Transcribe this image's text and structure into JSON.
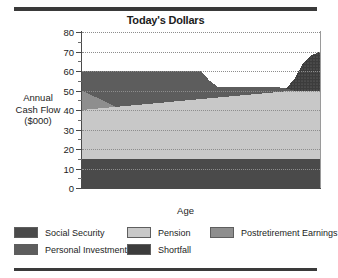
{
  "chart_title": "Today's Dollars",
  "axes": {
    "xlabel": "Age",
    "ylabel_lines": [
      "Annual",
      "Cash Flow",
      "($000)"
    ],
    "ylabel": "Annual Cash Flow ($000)",
    "yticks": [
      "80",
      "70",
      "60",
      "50",
      "40",
      "30",
      "20",
      "10",
      "0"
    ],
    "xticks": [
      "62",
      "67",
      "72",
      "77",
      "82",
      "87",
      "90"
    ]
  },
  "legend": {
    "items": [
      {
        "label": "Social Security",
        "color": "#4a4a4a",
        "pattern": "solid"
      },
      {
        "label": "Pension",
        "color": "#c8c8c8",
        "pattern": "solid"
      },
      {
        "label": "Postretirement Earnings",
        "color": "#8e8e8e",
        "pattern": "solid"
      },
      {
        "label": "Personal Investments",
        "color": "#5d5d5d",
        "pattern": "solid"
      },
      {
        "label": "Shortfall",
        "color": "#3c3c3c",
        "pattern": "dotted"
      }
    ]
  },
  "chart_data": {
    "type": "area",
    "stacked": true,
    "title": "Today's Dollars",
    "xlabel": "Age",
    "ylabel": "Annual Cash Flow ($000)",
    "xlim": [
      62,
      90
    ],
    "ylim": [
      0,
      80
    ],
    "ytick_step": 10,
    "grid": "horizontal-dotted",
    "legend_position": "bottom",
    "x": [
      62,
      63,
      64,
      65,
      66,
      67,
      68,
      69,
      70,
      71,
      72,
      73,
      74,
      75,
      76,
      77,
      78,
      79,
      80,
      81,
      82,
      83,
      84,
      85,
      86,
      87,
      88,
      89,
      90
    ],
    "series": [
      {
        "name": "Social Security",
        "color": "#4a4a4a",
        "values": [
          15,
          15,
          15,
          15,
          15,
          15,
          15,
          15,
          15,
          15,
          15,
          15,
          15,
          15,
          15,
          15,
          15,
          15,
          15,
          15,
          15,
          15,
          15,
          15,
          15,
          15,
          15,
          15,
          15
        ]
      },
      {
        "name": "Pension",
        "color": "#c8c8c8",
        "values": [
          25,
          25.4,
          25.8,
          26.2,
          26.6,
          27,
          27.4,
          27.8,
          28.2,
          28.6,
          29,
          29.4,
          29.8,
          30.2,
          30.6,
          31,
          31.4,
          31.8,
          32.2,
          32.6,
          33,
          33.4,
          33.8,
          34.2,
          34.6,
          35,
          35,
          35,
          35
        ]
      },
      {
        "name": "Postretirement Earnings",
        "color": "#8e8e8e",
        "values": [
          10,
          7.5,
          5,
          2.5,
          0,
          0,
          0,
          0,
          0,
          0,
          0,
          0,
          0,
          0,
          0,
          0,
          0,
          0,
          0,
          0,
          0,
          0,
          0,
          0,
          0,
          0,
          0,
          0,
          0
        ]
      },
      {
        "name": "Personal Investments",
        "color": "#5d5d5d",
        "values": [
          10,
          12.1,
          14.2,
          16.3,
          18.4,
          18,
          17.6,
          17.2,
          16.8,
          16.4,
          16,
          15.6,
          15.2,
          14.8,
          14.4,
          9,
          5.4,
          5,
          4.6,
          4.2,
          3.8,
          3.4,
          3,
          2.6,
          1.4,
          0,
          0,
          0,
          0
        ]
      },
      {
        "name": "Shortfall",
        "color": "#3c3c3c",
        "values": [
          0,
          0,
          0,
          0,
          0,
          0,
          0,
          0,
          0,
          0,
          0,
          0,
          0,
          0,
          0,
          0,
          0,
          0,
          0,
          0,
          0,
          0,
          0,
          0,
          0,
          6,
          14,
          18,
          20
        ]
      }
    ],
    "totals": [
      60,
      60,
      60,
      60,
      60,
      60,
      60,
      60,
      60,
      60,
      60,
      60,
      60,
      60,
      60,
      55,
      51.8,
      51.8,
      51.8,
      51.8,
      51.8,
      51.8,
      51.8,
      51.8,
      51,
      56,
      64,
      68,
      70
    ]
  }
}
